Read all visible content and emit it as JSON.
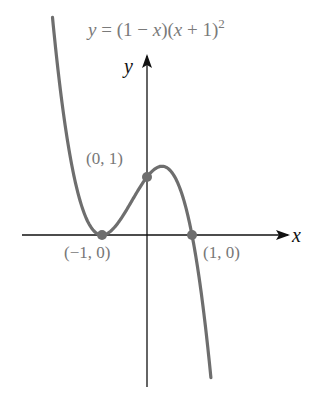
{
  "chart_data": {
    "type": "line",
    "equation": "y = (1 - x)(x + 1)^2",
    "xlabel": "x",
    "ylabel": "y",
    "xlim": [
      -2.8,
      3.2
    ],
    "ylim": [
      -2.7,
      4.0
    ],
    "grid": false,
    "legend": null,
    "series": [
      {
        "name": "y = (1 - x)(x + 1)^2",
        "function": "(1-x)*(x+1)^2",
        "x_range": [
          -2.1,
          1.42
        ],
        "color": "#6e6e6e"
      }
    ],
    "annotations": [
      {
        "label": "(0, 1)",
        "x": 0,
        "y": 1,
        "marker": true
      },
      {
        "label": "(−1, 0)",
        "x": -1,
        "y": 0,
        "marker": true
      },
      {
        "label": "(1, 0)",
        "x": 1,
        "y": 0,
        "marker": true
      }
    ]
  },
  "labels": {
    "title_prefix": "y",
    "title_eq": " = (1 − ",
    "title_x1": "x",
    "title_mid": ")(",
    "title_x2": "x",
    "title_end": " + 1)",
    "title_sup": "2",
    "x_axis": "x",
    "y_axis": "y",
    "pt_0_1": "(0, 1)",
    "pt_m1_0": "(−1, 0)",
    "pt_1_0": "(1, 0)"
  },
  "colors": {
    "curve": "#6e6e6e",
    "axis": "#111111",
    "label": "#777777",
    "point": "#6e6e6e"
  }
}
